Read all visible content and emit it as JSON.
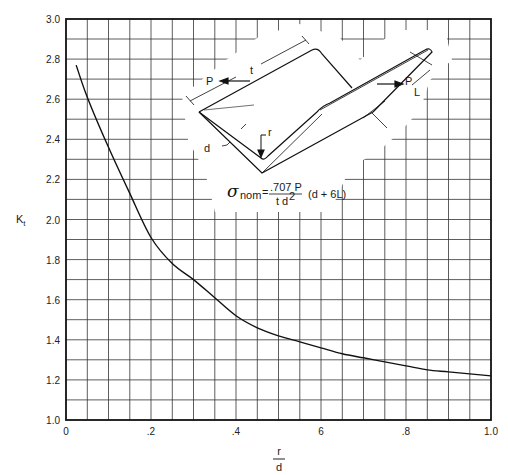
{
  "chart_data": {
    "type": "line",
    "title": "",
    "xlabel": "r/d",
    "xlabel_num": "r",
    "xlabel_den": "d",
    "ylabel": "Kt",
    "ylabel_main": "K",
    "ylabel_sub": "t",
    "xlim": [
      0,
      1.0
    ],
    "ylim": [
      1.0,
      3.0
    ],
    "grid": true,
    "x_major_step": 0.05,
    "y_major_step": 0.1,
    "x_tick_labels": [
      {
        "value": 0,
        "label": "0"
      },
      {
        "value": 0.2,
        "label": ".2"
      },
      {
        "value": 0.4,
        "label": ".4"
      },
      {
        "value": 0.6,
        "label": "6"
      },
      {
        "value": 0.8,
        "label": ".8"
      },
      {
        "value": 1.0,
        "label": "1.0"
      }
    ],
    "y_tick_labels": [
      {
        "value": 1.0,
        "label": "1.0"
      },
      {
        "value": 1.2,
        "label": "1.2"
      },
      {
        "value": 1.4,
        "label": "1.4"
      },
      {
        "value": 1.6,
        "label": "1.6"
      },
      {
        "value": 1.8,
        "label": "1.8"
      },
      {
        "value": 2.0,
        "label": "2.0"
      },
      {
        "value": 2.2,
        "label": "2.2"
      },
      {
        "value": 2.4,
        "label": "2.4"
      },
      {
        "value": 2.6,
        "label": "2.6"
      },
      {
        "value": 2.8,
        "label": "2.8"
      },
      {
        "value": 3.0,
        "label": "3.0"
      }
    ],
    "series": [
      {
        "name": "Kt",
        "x": [
          0.024,
          0.05,
          0.1,
          0.15,
          0.2,
          0.25,
          0.3,
          0.35,
          0.4,
          0.45,
          0.5,
          0.55,
          0.6,
          0.65,
          0.7,
          0.75,
          0.8,
          0.85,
          0.9,
          0.95,
          1.0
        ],
        "y": [
          2.77,
          2.61,
          2.36,
          2.13,
          1.91,
          1.78,
          1.7,
          1.61,
          1.52,
          1.46,
          1.42,
          1.39,
          1.36,
          1.33,
          1.31,
          1.29,
          1.27,
          1.25,
          1.24,
          1.23,
          1.22
        ]
      }
    ],
    "inset": {
      "labels": {
        "t": "t",
        "P": "P",
        "P_L_P": "P",
        "P_L_L": "L",
        "r": "r",
        "d": "d"
      },
      "formula": {
        "sigma": "σ",
        "sub": "nom",
        "eq": "=",
        "numerator": ".707 P",
        "denominator_t": "t",
        "denominator_d": "d",
        "denominator_exp": "2",
        "tail": "(d + 6L)"
      }
    }
  }
}
